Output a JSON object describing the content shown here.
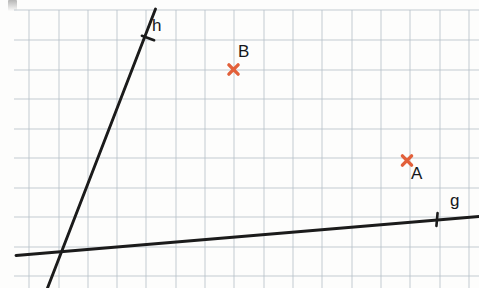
{
  "figure": {
    "background_color": "#fdfdfc",
    "grid": {
      "line_color": "#b9c3cb",
      "minor_line_color": "#d9dfe4",
      "spacing_px": 29.3,
      "x_lines": [
        29,
        59,
        88,
        117,
        146,
        176,
        205,
        234,
        264,
        293,
        322,
        352,
        381,
        410,
        440,
        469
      ],
      "y_lines": [
        10,
        40,
        70,
        99,
        129,
        158,
        188,
        217,
        247,
        276
      ],
      "top": 10,
      "bottom": 288,
      "left": 14,
      "right": 479
    },
    "ink_color": "#1b1b1b",
    "marker_color": "#e2603a"
  },
  "lines": [
    {
      "name": "h",
      "label": "h",
      "label_x": 152,
      "label_y": 17,
      "x1": 155.5,
      "y1": 9,
      "x2": 47.5,
      "y2": 288,
      "stroke_width": 2.9,
      "tick": {
        "x": 148,
        "y": 38,
        "length": 13,
        "angle_deg": 20
      }
    },
    {
      "name": "g",
      "label": "g",
      "label_x": 450,
      "label_y": 192,
      "x1": 16,
      "y1": 255.5,
      "x2": 479,
      "y2": 216.5,
      "stroke_width": 2.9,
      "tick": {
        "x": 437,
        "y": 219.5,
        "length": 13,
        "angle_deg": 95
      }
    }
  ],
  "points": [
    {
      "name": "A",
      "label": "A",
      "marker": "x-cross",
      "marker_x": 407,
      "marker_y": 160.5,
      "label_x": 411,
      "label_y": 165,
      "color": "#e2603a"
    },
    {
      "name": "B",
      "label": "B",
      "marker": "x-cross",
      "marker_x": 233.5,
      "marker_y": 69.5,
      "label_x": 238,
      "label_y": 43,
      "color": "#e2603a"
    }
  ],
  "artifacts": {
    "corner_smudge_label": "scan-artifact-top-left"
  }
}
